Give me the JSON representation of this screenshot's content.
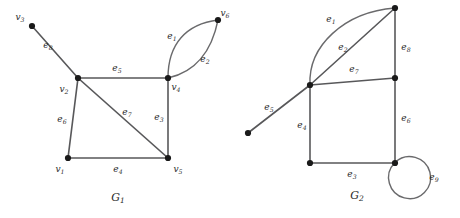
{
  "figure": {
    "background_color": "#ffffff",
    "edge_color": "#58585a",
    "vertex_color": "#1a1a1a",
    "label_color": "#2b2b2b"
  },
  "graphs": [
    {
      "id": "G1",
      "caption_base": "G",
      "caption_sub": "1",
      "caption_x": 118,
      "caption_y": 201,
      "vertices": [
        {
          "name": "v3",
          "base": "v",
          "sub": "3",
          "x": 32,
          "y": 26,
          "label_x": 20,
          "label_y": 20,
          "anchor": "middle"
        },
        {
          "name": "v2",
          "base": "v",
          "sub": "2",
          "x": 78,
          "y": 78,
          "label_x": 64,
          "label_y": 92,
          "anchor": "middle"
        },
        {
          "name": "v4",
          "base": "v",
          "sub": "4",
          "x": 168,
          "y": 78,
          "label_x": 176,
          "label_y": 90,
          "anchor": "middle"
        },
        {
          "name": "v6",
          "base": "v",
          "sub": "6",
          "x": 218,
          "y": 20,
          "label_x": 225,
          "label_y": 16,
          "anchor": "middle"
        },
        {
          "name": "v1",
          "base": "v",
          "sub": "1",
          "x": 68,
          "y": 158,
          "label_x": 60,
          "label_y": 172,
          "anchor": "middle"
        },
        {
          "name": "v5",
          "base": "v",
          "sub": "5",
          "x": 168,
          "y": 158,
          "label_x": 178,
          "label_y": 172,
          "anchor": "middle"
        }
      ],
      "edges": [
        {
          "name": "e1",
          "base": "e",
          "sub": "1",
          "kind": "curve",
          "path": "M 168 78 C 168 44 186 24 218 20",
          "label_x": 172,
          "label_y": 39
        },
        {
          "name": "e2",
          "base": "e",
          "sub": "2",
          "kind": "curve",
          "path": "M 168 78 C 196 72 212 50 218 20",
          "label_x": 205,
          "label_y": 62
        },
        {
          "name": "e3",
          "base": "e",
          "sub": "3",
          "kind": "line",
          "x1": 168,
          "y1": 78,
          "x2": 168,
          "y2": 158,
          "label_x": 159,
          "label_y": 120
        },
        {
          "name": "e4",
          "base": "e",
          "sub": "4",
          "kind": "line",
          "x1": 68,
          "y1": 158,
          "x2": 168,
          "y2": 158,
          "label_x": 118,
          "label_y": 172
        },
        {
          "name": "e5",
          "base": "e",
          "sub": "5",
          "kind": "line",
          "x1": 78,
          "y1": 78,
          "x2": 168,
          "y2": 78,
          "label_x": 117,
          "label_y": 71
        },
        {
          "name": "e6",
          "base": "e",
          "sub": "6",
          "kind": "line",
          "x1": 68,
          "y1": 158,
          "x2": 78,
          "y2": 78,
          "label_x": 62,
          "label_y": 122
        },
        {
          "name": "e7",
          "base": "e",
          "sub": "7",
          "kind": "line",
          "x1": 78,
          "y1": 78,
          "x2": 168,
          "y2": 158,
          "label_x": 127,
          "label_y": 115
        },
        {
          "name": "e8",
          "base": "e",
          "sub": "8",
          "kind": "line",
          "x1": 32,
          "y1": 26,
          "x2": 78,
          "y2": 78,
          "label_x": 48,
          "label_y": 48
        }
      ]
    },
    {
      "id": "G2",
      "caption_base": "G",
      "caption_sub": "2",
      "caption_x": 357,
      "caption_y": 199,
      "vertices": [
        {
          "name": "g2-top-right",
          "x": 395,
          "y": 8
        },
        {
          "name": "g2-junction",
          "x": 310,
          "y": 85
        },
        {
          "name": "g2-mid-right",
          "x": 395,
          "y": 78
        },
        {
          "name": "g2-pendant",
          "x": 248,
          "y": 133
        },
        {
          "name": "g2-bottom-left",
          "x": 310,
          "y": 163
        },
        {
          "name": "g2-bottom-right",
          "x": 395,
          "y": 163
        }
      ],
      "edges": [
        {
          "name": "e1",
          "base": "e",
          "sub": "1",
          "kind": "curve",
          "path": "M 310 85 C 308 46 344 12 395 8",
          "label_x": 331,
          "label_y": 22
        },
        {
          "name": "e2",
          "base": "e",
          "sub": "2",
          "kind": "line",
          "x1": 310,
          "y1": 85,
          "x2": 395,
          "y2": 8,
          "label_x": 343,
          "label_y": 50
        },
        {
          "name": "e3",
          "base": "e",
          "sub": "3",
          "kind": "line",
          "x1": 310,
          "y1": 163,
          "x2": 395,
          "y2": 163,
          "label_x": 352,
          "label_y": 177
        },
        {
          "name": "e4",
          "base": "e",
          "sub": "4",
          "kind": "line",
          "x1": 310,
          "y1": 85,
          "x2": 310,
          "y2": 163,
          "label_x": 302,
          "label_y": 128
        },
        {
          "name": "e5",
          "base": "e",
          "sub": "5",
          "kind": "line",
          "x1": 248,
          "y1": 133,
          "x2": 310,
          "y2": 85,
          "label_x": 269,
          "label_y": 110
        },
        {
          "name": "e6",
          "base": "e",
          "sub": "6",
          "kind": "line",
          "x1": 395,
          "y1": 78,
          "x2": 395,
          "y2": 163,
          "label_x": 406,
          "label_y": 121
        },
        {
          "name": "e7",
          "base": "e",
          "sub": "7",
          "kind": "line",
          "x1": 310,
          "y1": 85,
          "x2": 395,
          "y2": 78,
          "label_x": 354,
          "label_y": 72
        },
        {
          "name": "e8",
          "base": "e",
          "sub": "8",
          "kind": "line",
          "x1": 395,
          "y1": 8,
          "x2": 395,
          "y2": 78,
          "label_x": 406,
          "label_y": 50
        },
        {
          "name": "e9",
          "base": "e",
          "sub": "9",
          "kind": "loop",
          "path": "M 395 163 m -0.5 0 a 21 21 0 1 0 0.5 -0.5 Z",
          "label_x": 434,
          "label_y": 180
        }
      ]
    }
  ]
}
